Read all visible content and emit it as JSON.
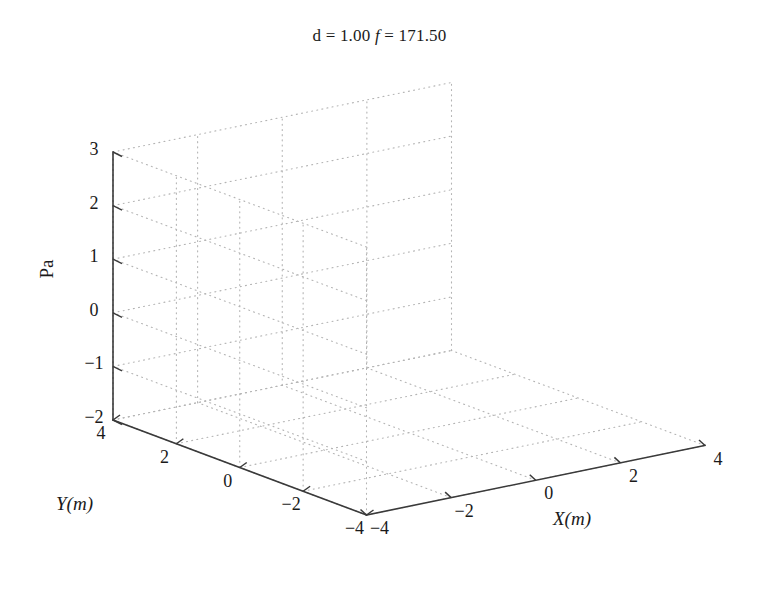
{
  "figure": {
    "width": 759,
    "height": 590,
    "background": "#ffffff",
    "line_color": "#3a3a3a",
    "grid_color": "#b4b4b4",
    "text_color": "#1a1a1a"
  },
  "title": {
    "prefix": "d = 1.00",
    "italic_symbol": "f",
    "suffix": "= 171.50",
    "full": "d = 1.00 f = 171.50"
  },
  "axes": {
    "x": {
      "label": "X(m)",
      "label_text": "X",
      "label_unit": "(m)",
      "ticks": [
        -4,
        -2,
        0,
        2,
        4
      ],
      "tick_labels": [
        "−4",
        "−2",
        "0",
        "2",
        "4"
      ],
      "range": [
        -4,
        4
      ]
    },
    "y": {
      "label": "Y(m)",
      "label_text": "Y",
      "label_unit": "(m)",
      "ticks": [
        4,
        2,
        0,
        -2,
        -4
      ],
      "tick_labels": [
        "4",
        "2",
        "0",
        "−2",
        "−4"
      ],
      "range": [
        -4,
        4
      ]
    },
    "z": {
      "label": "Pa",
      "ticks": [
        3,
        2,
        1,
        0,
        -1,
        -2
      ],
      "tick_labels": [
        "3",
        "2",
        "1",
        "0",
        "−1",
        "−2"
      ],
      "range": [
        -2,
        3
      ]
    }
  },
  "chart_data": {
    "type": "surface",
    "xlabel": "X(m)",
    "ylabel": "Y(m)",
    "zlabel": "Pa",
    "xlim": [
      -4,
      4
    ],
    "ylim": [
      -4,
      4
    ],
    "zlim": [
      -2,
      3
    ],
    "xticks": [
      -4,
      -2,
      0,
      2,
      4
    ],
    "yticks": [
      -4,
      -2,
      0,
      2,
      4
    ],
    "zticks": [
      -2,
      -1,
      0,
      1,
      2,
      3
    ],
    "grid": true,
    "legend": "none",
    "colormap": "gray",
    "shading": "interp",
    "view": {
      "azimuth": -37.5,
      "elevation": 30
    },
    "surface_model": {
      "note": "z(x,y) computed on a grid from a radial model: a narrow singular central spike plus a damped ring and a broad pedestal.",
      "grid_n": 110,
      "spike_amplitude": 2.45,
      "spike_width": 0.16,
      "ring_amplitude": -1.05,
      "ring_radius": 1.35,
      "ring_width": 0.95,
      "pedestal_amplitude": 0.55,
      "pedestal_width": 3.1,
      "baseline": -0.62,
      "wave_number": 1.55,
      "wave_amplitude": 0.3,
      "wave_decay": 0.3
    },
    "peak": {
      "x": 0.0,
      "y": 0.0,
      "z": 2.1
    },
    "trough": {
      "radius": 1.35,
      "z": -1.05
    },
    "edge_value": -0.35,
    "samples": {
      "radius": [
        0.0,
        0.1,
        0.2,
        0.3,
        0.5,
        0.75,
        1.0,
        1.35,
        1.75,
        2.25,
        2.8,
        3.4,
        4.0,
        4.8,
        5.6
      ],
      "z": [
        2.1,
        1.65,
        0.95,
        0.45,
        -0.1,
        -0.55,
        -0.85,
        -1.02,
        -0.9,
        -0.6,
        -0.38,
        -0.28,
        -0.24,
        -0.26,
        -0.3
      ]
    }
  }
}
